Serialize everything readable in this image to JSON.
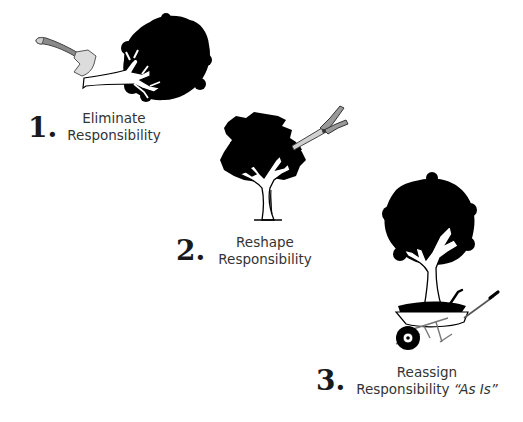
{
  "steps": [
    {
      "number": "1.",
      "line1": "Eliminate",
      "line2": "Responsibility",
      "illustration": "axe-chopping-tree-icon"
    },
    {
      "number": "2.",
      "line1": "Reshape",
      "line2": "Responsibility",
      "illustration": "shears-pruning-tree-icon"
    },
    {
      "number": "3.",
      "line1": "Reassign",
      "line2": "Responsibility",
      "line2_emphasis": "“As Is”",
      "illustration": "tree-in-wheelbarrow-icon"
    }
  ],
  "colors": {
    "background": "#ffffff",
    "ink": "#000000",
    "tool_metal": "#d9d9d9",
    "tool_handle": "#8a8a8a",
    "text": "#333333"
  }
}
